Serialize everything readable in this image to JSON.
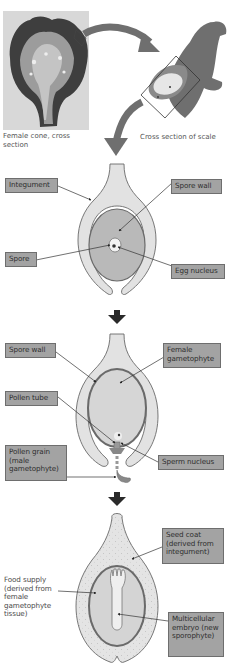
{
  "figure": {
    "panel_top": {
      "photo_caption": "Female cone, cross section",
      "scale_caption": "Cross section of scale"
    },
    "stage1": {
      "labels": {
        "integument": "Integument",
        "spore_wall": "Spore wall",
        "spore": "Spore",
        "egg_nucleus": "Egg nucleus"
      }
    },
    "stage2": {
      "labels": {
        "spore_wall": "Spore wall",
        "female_gametophyte": "Female gametophyte",
        "pollen_tube": "Pollen tube",
        "pollen_grain": "Pollen grain (male gametophyte)",
        "sperm_nucleus": "Sperm nucleus"
      }
    },
    "stage3": {
      "labels": {
        "seed_coat": "Seed coat (derived from integument)",
        "food_supply": "Food supply (derived from female gametophyte tissue)",
        "embryo": "Multicellular embryo (new sporophyte)"
      }
    },
    "colors": {
      "label_fill": "#a3a3a3",
      "integument_fill": "#e2e2e2",
      "spore_fill": "#b9b9b9",
      "gametophyte_fill": "#d6d6d6",
      "outline": "#6a6a6a",
      "arrow": "#2a2a2a",
      "scale_fill": "#6f6f6f"
    }
  }
}
